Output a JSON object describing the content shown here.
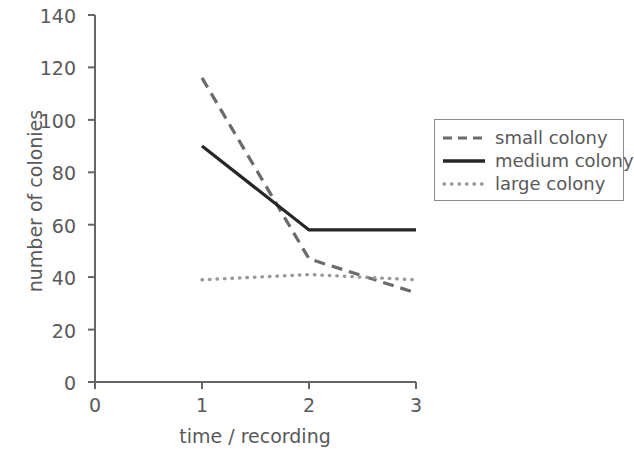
{
  "chart_data": {
    "type": "line",
    "title": "",
    "xlabel": "time / recording",
    "ylabel": "number of colonies",
    "x": [
      1,
      2,
      3
    ],
    "xlim": [
      0,
      3
    ],
    "ylim": [
      0,
      140
    ],
    "xticks": [
      "0",
      "1",
      "2",
      "3"
    ],
    "yticks": [
      "0",
      "20",
      "40",
      "60",
      "80",
      "100",
      "120",
      "140"
    ],
    "grid": false,
    "legend_position": "right",
    "series": [
      {
        "name": "small colony",
        "values": [
          116,
          47,
          34
        ],
        "style": "dashed",
        "color": "#6b6b6b"
      },
      {
        "name": "medium colony",
        "values": [
          90,
          58,
          58
        ],
        "style": "solid",
        "color": "#262626"
      },
      {
        "name": "large colony",
        "values": [
          39,
          41,
          39
        ],
        "style": "dotted",
        "color": "#999999"
      }
    ]
  },
  "axes": {
    "x_title": "time / recording",
    "y_title": "number of colonies",
    "x_tick_labels": [
      "0",
      "1",
      "2",
      "3"
    ],
    "y_tick_labels": [
      "0",
      "20",
      "40",
      "60",
      "80",
      "100",
      "120",
      "140"
    ],
    "axis_color": "#666666"
  },
  "legend": {
    "entries": [
      {
        "label": "small colony",
        "style": "dashed"
      },
      {
        "label": "medium colony",
        "style": "solid"
      },
      {
        "label": "large colony",
        "style": "dotted"
      }
    ]
  },
  "colors": {
    "background": "#ffffff",
    "axis": "#666666",
    "text": "#595959",
    "small": "#6b6b6b",
    "medium": "#262626",
    "large": "#999999"
  }
}
